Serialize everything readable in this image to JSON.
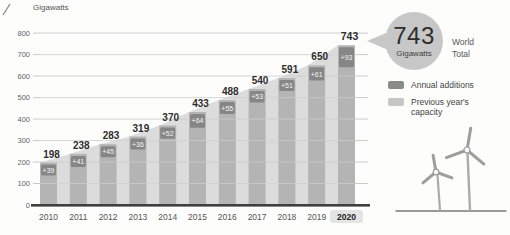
{
  "figure": {
    "callout": {
      "value": "743",
      "unit": "Gigawatts",
      "label": "World Total"
    },
    "legend": {
      "items": [
        {
          "label": "Annual additions",
          "color": "#8a8a8a"
        },
        {
          "label": "Previous year's capacity",
          "color": "#c6c6c6"
        }
      ]
    },
    "illustration": "wind-turbines-icon"
  },
  "chart_data": {
    "type": "bar",
    "ylabel": "Gigawatts",
    "categories": [
      "2010",
      "2011",
      "2012",
      "2013",
      "2014",
      "2015",
      "2016",
      "2017",
      "2018",
      "2019",
      "2020"
    ],
    "total_capacity_gw": [
      198,
      238,
      283,
      319,
      370,
      433,
      488,
      540,
      591,
      650,
      743
    ],
    "bar_total_labels": [
      "198",
      "238",
      "283",
      "319",
      "370",
      "433",
      "488",
      "540",
      "591",
      "650",
      "743"
    ],
    "annual_additions_gw": [
      39,
      41,
      45,
      36,
      52,
      64,
      55,
      53,
      51,
      61,
      93
    ],
    "annual_additions_labels": [
      "+39",
      "+41",
      "+45",
      "+36",
      "+52",
      "+64",
      "+55",
      "+53",
      "+51",
      "+61",
      "+93"
    ],
    "ylim": [
      0,
      800
    ],
    "yticks": [
      800,
      700,
      600,
      500,
      400,
      300,
      200,
      100,
      0
    ],
    "grid": true,
    "legend_position": "right",
    "highlighted_category": "2020",
    "colors": {
      "bar": "#b4b4b4",
      "additions_badge": "#868686",
      "badge_text": "#f5f5f5",
      "background_area": "#dcdcdc",
      "gridline": "#bebebe",
      "baseline": "#3f3f3f",
      "axis_text": "#666666",
      "label_text": "#2d2d2d",
      "highlight_bg": "#e4e4e4"
    }
  }
}
